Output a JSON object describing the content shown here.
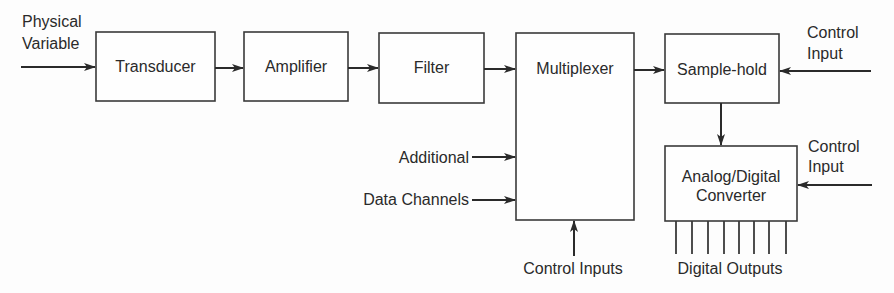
{
  "diagram": {
    "type": "block-diagram",
    "blocks": {
      "transducer": "Transducer",
      "amplifier": "Amplifier",
      "filter": "Filter",
      "multiplexer": "Multiplexer",
      "sample_hold": "Sample-hold",
      "adc_line1": "Analog/Digital",
      "adc_line2": "Converter"
    },
    "labels": {
      "physical_variable_line1": "Physical",
      "physical_variable_line2": "Variable",
      "additional": "Additional",
      "data_channels": "Data Channels",
      "control_inputs": "Control Inputs",
      "sh_control_line1": "Control",
      "sh_control_line2": "Input",
      "adc_control_line1": "Control",
      "adc_control_line2": "Input",
      "digital_outputs": "Digital Outputs"
    },
    "digital_output_count": 8,
    "flow": [
      "Physical Variable -> Transducer",
      "Transducer -> Amplifier",
      "Amplifier -> Filter",
      "Filter -> Multiplexer",
      "Additional Data Channels -> Multiplexer",
      "Control Inputs -> Multiplexer",
      "Multiplexer -> Sample-hold",
      "Control Input -> Sample-hold",
      "Sample-hold -> Analog/Digital Converter",
      "Control Input -> Analog/Digital Converter",
      "Analog/Digital Converter -> Digital Outputs"
    ]
  }
}
